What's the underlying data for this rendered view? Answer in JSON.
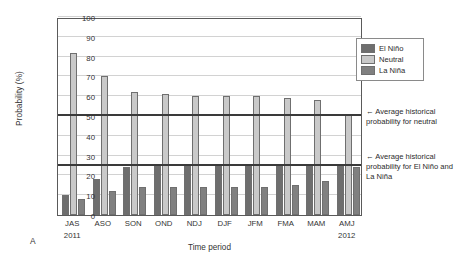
{
  "panel": {
    "label": "A"
  },
  "legend": {
    "position": "top-right",
    "items": [
      {
        "label": "El Niño",
        "color": "#6e6e6e",
        "key": "elnino"
      },
      {
        "label": "Neutral",
        "color": "#c9c9c9",
        "key": "neutral"
      },
      {
        "label": "La Niña",
        "color": "#808080",
        "key": "lanina"
      }
    ]
  },
  "annotations": [
    {
      "id": "callout-neutral",
      "arrow": "←",
      "text": "Average historical probability for neutral",
      "value": 50
    },
    {
      "id": "callout-enso",
      "arrow": "←",
      "text": "Average historical probability for El Niño and La Niña",
      "value": 25
    }
  ],
  "axis": {
    "y_ticks": [
      0,
      10,
      20,
      30,
      40,
      50,
      60,
      70,
      80,
      90,
      100
    ],
    "year_left": "2011",
    "year_right": "2012"
  },
  "chart_data": {
    "type": "bar",
    "title": "",
    "xlabel": "Time period",
    "ylabel": "Probability (%)",
    "ylim": [
      0,
      100
    ],
    "ytick_step": 10,
    "grid": true,
    "legend_position": "top-right",
    "categories": [
      "JAS",
      "ASO",
      "SON",
      "OND",
      "NDJ",
      "DJF",
      "JFM",
      "FMA",
      "MAM",
      "AMJ"
    ],
    "category_years": [
      "2011",
      "",
      "",
      "",
      "",
      "",
      "",
      "",
      "",
      "2012"
    ],
    "series": [
      {
        "name": "El Niño",
        "color": "#6e6e6e",
        "values": [
          10,
          18,
          24,
          25,
          26,
          26,
          26,
          26,
          25,
          25
        ]
      },
      {
        "name": "Neutral",
        "color": "#c9c9c9",
        "values": [
          82,
          70,
          62,
          61,
          60,
          60,
          60,
          59,
          58,
          51
        ]
      },
      {
        "name": "La Niña",
        "color": "#808080",
        "values": [
          8,
          12,
          14,
          14,
          14,
          14,
          14,
          15,
          17,
          24
        ]
      }
    ],
    "reference_lines": [
      {
        "name": "Average historical probability for neutral",
        "value": 50,
        "color": "#3a3a3a"
      },
      {
        "name": "Average historical probability for El Niño and La Niña",
        "value": 25,
        "color": "#3a3a3a"
      }
    ]
  }
}
